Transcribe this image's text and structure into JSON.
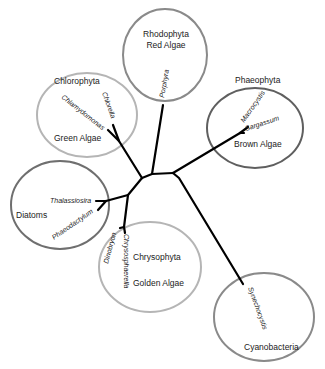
{
  "diagram": {
    "type": "unrooted phylogenetic tree",
    "colors": {
      "branch": "#000000",
      "circle_light": "#b5b5b5",
      "circle_mid": "#8a8a8a",
      "circle_dark": "#5f5f5f"
    },
    "clades": [
      {
        "id": "rhodophyta",
        "group": "Rhodophyta",
        "common": "Red Algae",
        "species": [
          "Porphyra"
        ]
      },
      {
        "id": "chlorophyta",
        "group": "Chlorophyta",
        "common": "Green Algae",
        "species": [
          "Chlamydomonas",
          "Chlorella"
        ]
      },
      {
        "id": "phaeophyta",
        "group": "Phaeophyta",
        "common": "Brown Algae",
        "species": [
          "Macrocystis",
          "Sargassum"
        ]
      },
      {
        "id": "diatoms",
        "group": "Diatoms",
        "common": "",
        "species": [
          "Thalassiosira",
          "Phaeodactylum"
        ]
      },
      {
        "id": "chrysophyta",
        "group": "Chrysophyta",
        "common": "Golden Algae",
        "species": [
          "Dinobryon",
          "Chrysosphaerella"
        ]
      },
      {
        "id": "cyanobacteria",
        "group": "Cyanobacteria",
        "common": "",
        "species": [
          "Synechocystis"
        ]
      }
    ]
  }
}
